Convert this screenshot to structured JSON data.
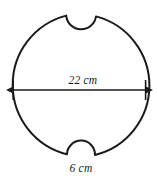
{
  "figure": {
    "type": "geometry-diagram",
    "background_color": "#ffffff",
    "stroke_color": "#1a1a1a",
    "stroke_width": 2,
    "shape": {
      "name": "circle",
      "center_x": 79.5,
      "center_y": 85.5,
      "radius": 71.5
    },
    "notches": [
      {
        "name": "top-notch",
        "position": "top",
        "center_x": 81,
        "center_y": 15,
        "radius": 15,
        "direction": "inward"
      },
      {
        "name": "bottom-notch",
        "position": "bottom",
        "center_x": 81,
        "center_y": 157,
        "radius": 14,
        "direction": "inward"
      }
    ],
    "dimensions": [
      {
        "name": "diameter",
        "label": "22 cm",
        "value": 22,
        "unit": "cm",
        "label_x": 83,
        "label_y": 84,
        "arrow": {
          "x1": 14,
          "x2": 145,
          "y": 90,
          "style": "double-headed"
        }
      },
      {
        "name": "notch-width",
        "label": "6 cm",
        "value": 6,
        "unit": "cm",
        "label_x": 81,
        "label_y": 172
      }
    ]
  }
}
